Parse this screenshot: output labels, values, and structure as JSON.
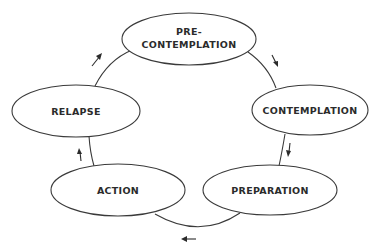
{
  "diagram": {
    "type": "cycle",
    "title": "",
    "stages": [
      {
        "id": "precontemplation",
        "label_lines": [
          "PRE-",
          "CONTEMPLATION"
        ]
      },
      {
        "id": "contemplation",
        "label_lines": [
          "CONTEMPLATION"
        ]
      },
      {
        "id": "preparation",
        "label_lines": [
          "PREPARATION"
        ]
      },
      {
        "id": "action",
        "label_lines": [
          "ACTION"
        ]
      },
      {
        "id": "relapse",
        "label_lines": [
          "RELAPSE"
        ]
      }
    ],
    "flow": [
      {
        "from": "precontemplation",
        "to": "contemplation",
        "direction": "clockwise"
      },
      {
        "from": "contemplation",
        "to": "preparation",
        "direction": "clockwise"
      },
      {
        "from": "preparation",
        "to": "action",
        "direction": "clockwise"
      },
      {
        "from": "action",
        "to": "relapse",
        "direction": "clockwise"
      },
      {
        "from": "relapse",
        "to": "precontemplation",
        "direction": "clockwise"
      }
    ],
    "colors": {
      "stroke": "#3a3a3a",
      "text": "#2b2b2b",
      "background": "#ffffff"
    }
  }
}
